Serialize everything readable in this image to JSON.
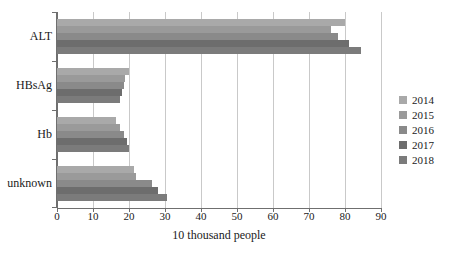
{
  "chart_data": {
    "type": "bar",
    "orientation": "horizontal",
    "title": "",
    "xlabel": "10 thousand people",
    "ylabel": "",
    "categories": [
      "ALT",
      "HBsAg",
      "Hb",
      "unknown"
    ],
    "xlim": [
      0,
      90
    ],
    "xticks": [
      0,
      10,
      20,
      30,
      40,
      50,
      60,
      70,
      80,
      90
    ],
    "grid": true,
    "legend_position": "right",
    "series": [
      {
        "name": "2014",
        "color": "#a9a9a9",
        "values": [
          80.0,
          20.0,
          16.5,
          21.5
        ]
      },
      {
        "name": "2015",
        "color": "#9a9a9a",
        "values": [
          76.0,
          19.0,
          17.5,
          22.0
        ]
      },
      {
        "name": "2016",
        "color": "#8a8a8a",
        "values": [
          78.0,
          18.5,
          18.5,
          26.5
        ]
      },
      {
        "name": "2017",
        "color": "#6d6d6d",
        "values": [
          81.0,
          18.0,
          19.5,
          28.0
        ]
      },
      {
        "name": "2018",
        "color": "#7b7b7b",
        "values": [
          84.5,
          17.5,
          20.0,
          30.5
        ]
      }
    ]
  }
}
